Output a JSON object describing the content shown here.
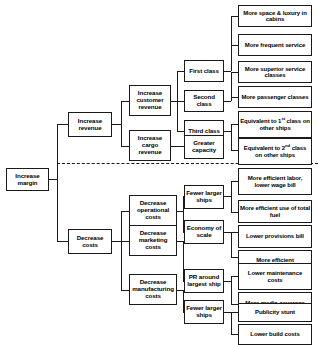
{
  "diagram": {
    "type": "issue-tree",
    "divider": {
      "style": "dashed",
      "label": ""
    },
    "nodes": {
      "root": {
        "label": "Increase margin"
      },
      "level1": [
        {
          "id": "increase-revenue",
          "label": "Increase revenue"
        },
        {
          "id": "decrease-costs",
          "label": "Decrease costs"
        }
      ],
      "level2": [
        {
          "id": "increase-customer-revenue",
          "label": "Increase customer revenue"
        },
        {
          "id": "increase-cargo-revenue",
          "label": "Increase cargo revenue"
        },
        {
          "id": "decrease-operational-costs",
          "label": "Decrease operational costs"
        },
        {
          "id": "decrease-marketing-costs",
          "label": "Decrease marketing costs"
        },
        {
          "id": "decrease-manufacturing-costs",
          "label": "Decrease manufacturing costs"
        }
      ],
      "level3": [
        {
          "id": "first-class",
          "label": "First class"
        },
        {
          "id": "second-class",
          "label": "Second class"
        },
        {
          "id": "third-class",
          "label": "Third class"
        },
        {
          "id": "greater-capacity",
          "label": "Greater capacity"
        },
        {
          "id": "fewer-larger-ships-ops",
          "label": "Fewer larger ships"
        },
        {
          "id": "economy-of-scale",
          "label": "Economy of scale"
        },
        {
          "id": "pr-around-largest-ship",
          "label": "PR around largest ship"
        },
        {
          "id": "fewer-larger-ships-mfg",
          "label": "Fewer larger ships"
        }
      ],
      "level4": [
        {
          "id": "more-space-luxury-cabins",
          "label": "More space & luxury in cabins",
          "html": "More space &amp; luxury in cabins"
        },
        {
          "id": "more-frequent-service",
          "label": "More frequent service",
          "html": "More frequent service"
        },
        {
          "id": "more-superior-service-classes",
          "label": "More superior service classes",
          "html": "More superior service classes"
        },
        {
          "id": "more-passenger-classes",
          "label": "More passenger classes",
          "html": "More passenger classes"
        },
        {
          "id": "equivalent-first-class-other-ships",
          "label": "Equivalent to 1st class on other ships",
          "html": "Equivalent to 1<sup>st</sup> class on other ships"
        },
        {
          "id": "equivalent-second-class-other-ships",
          "label": "Equivalent to 2nd class on other ships",
          "html": "Equivalent to 2<sup>nd</sup> class on other ships"
        },
        {
          "id": "more-efficient-labor-lower-wage-bill",
          "label": "More efficient labor, lower wage bill",
          "html": "More efficient labor, lower wage bill"
        },
        {
          "id": "more-efficient-use-of-total-fuel",
          "label": "More efficient use of total fuel",
          "html": "More efficient use of total fuel"
        },
        {
          "id": "lower-provisions-bill",
          "label": "Lower provisions bill",
          "html": "Lower provisions bill"
        },
        {
          "id": "more-efficient",
          "label": "More efficient",
          "html": "More efficient"
        },
        {
          "id": "lower-maintenance-costs",
          "label": "Lower maintenance costs",
          "html": "Lower maintenance costs"
        },
        {
          "id": "more-media-coverage",
          "label": "More media coverage",
          "html": "More media coverage"
        },
        {
          "id": "publicity-stunt",
          "label": "Publicity stunt",
          "html": "Publicity stunt"
        },
        {
          "id": "lower-build-costs",
          "label": "Lower build costs",
          "html": "Lower build costs"
        }
      ]
    },
    "colors": {
      "box_border": "#1a1a1a",
      "box_fill": "#ffffff",
      "connector": "#1a1a1a",
      "text": "#000000",
      "background": "#ffffff"
    }
  }
}
